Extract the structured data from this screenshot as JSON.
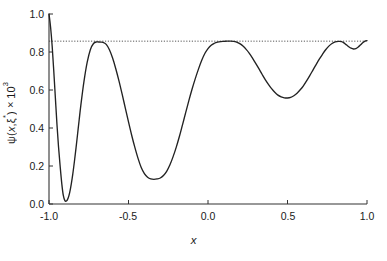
{
  "chart_data": {
    "type": "line",
    "title": "",
    "subtitle": "",
    "xlabel": "x",
    "ylabel": "ψ(x,ξ*)×10³",
    "ylabel_parts": {
      "psi": "ψ(",
      "x": "x",
      "comma": ",",
      "xi": "ξ",
      "star": "*",
      "close": ")×10",
      "exponent": "3"
    },
    "xlim": [
      -1.0,
      1.0
    ],
    "ylim": [
      0.0,
      1.0
    ],
    "xticks": [
      -1.0,
      -0.5,
      0.0,
      0.5,
      1.0
    ],
    "xtick_labels": [
      "-1.0",
      "-0.5",
      "0.0",
      "0.5",
      "1.0"
    ],
    "yticks": [
      0.0,
      0.2,
      0.4,
      0.6,
      0.8,
      1.0
    ],
    "ytick_labels": [
      "0.0",
      "0.2",
      "0.4",
      "0.6",
      "0.8",
      "1.0"
    ],
    "grid": false,
    "legend": null,
    "legend_position": "none",
    "line_color": "#222222",
    "reference_line": {
      "name": "asymptote",
      "style": "dotted",
      "orientation": "horizontal",
      "y": 0.857,
      "color": "#444444"
    },
    "series": [
      {
        "name": "psi",
        "color": "#222222",
        "x": [
          -1.0,
          -0.99,
          -0.98,
          -0.97,
          -0.96,
          -0.95,
          -0.94,
          -0.93,
          -0.92,
          -0.91,
          -0.9,
          -0.89,
          -0.88,
          -0.87,
          -0.86,
          -0.85,
          -0.84,
          -0.83,
          -0.82,
          -0.81,
          -0.8,
          -0.78,
          -0.76,
          -0.74,
          -0.72,
          -0.7,
          -0.68,
          -0.66,
          -0.64,
          -0.62,
          -0.6,
          -0.58,
          -0.56,
          -0.54,
          -0.52,
          -0.5,
          -0.48,
          -0.46,
          -0.44,
          -0.42,
          -0.4,
          -0.38,
          -0.36,
          -0.34,
          -0.32,
          -0.3,
          -0.28,
          -0.26,
          -0.24,
          -0.22,
          -0.2,
          -0.18,
          -0.16,
          -0.14,
          -0.12,
          -0.1,
          -0.08,
          -0.06,
          -0.04,
          -0.02,
          0.0,
          0.02,
          0.04,
          0.06,
          0.08,
          0.1,
          0.12,
          0.14,
          0.16,
          0.18,
          0.2,
          0.22,
          0.24,
          0.26,
          0.28,
          0.3,
          0.32,
          0.34,
          0.36,
          0.38,
          0.4,
          0.42,
          0.44,
          0.46,
          0.48,
          0.5,
          0.52,
          0.54,
          0.56,
          0.58,
          0.6,
          0.62,
          0.64,
          0.66,
          0.68,
          0.7,
          0.72,
          0.74,
          0.76,
          0.78,
          0.8,
          0.82,
          0.84,
          0.855,
          0.87,
          0.885,
          0.9,
          0.915,
          0.93,
          0.945,
          0.96,
          0.975,
          0.99,
          1.0
        ],
        "y": [
          1.0,
          0.93,
          0.83,
          0.7,
          0.56,
          0.42,
          0.3,
          0.2,
          0.11,
          0.045,
          0.018,
          0.016,
          0.03,
          0.06,
          0.105,
          0.16,
          0.225,
          0.295,
          0.37,
          0.445,
          0.518,
          0.645,
          0.745,
          0.812,
          0.845,
          0.853,
          0.852,
          0.851,
          0.84,
          0.812,
          0.768,
          0.712,
          0.648,
          0.578,
          0.505,
          0.432,
          0.362,
          0.298,
          0.24,
          0.192,
          0.16,
          0.141,
          0.132,
          0.13,
          0.132,
          0.137,
          0.15,
          0.172,
          0.205,
          0.248,
          0.298,
          0.355,
          0.418,
          0.482,
          0.545,
          0.605,
          0.66,
          0.71,
          0.755,
          0.792,
          0.818,
          0.836,
          0.846,
          0.852,
          0.855,
          0.856,
          0.857,
          0.857,
          0.856,
          0.852,
          0.844,
          0.831,
          0.814,
          0.793,
          0.768,
          0.74,
          0.712,
          0.683,
          0.655,
          0.63,
          0.607,
          0.588,
          0.573,
          0.564,
          0.559,
          0.558,
          0.561,
          0.57,
          0.583,
          0.601,
          0.622,
          0.648,
          0.676,
          0.705,
          0.734,
          0.762,
          0.788,
          0.812,
          0.831,
          0.845,
          0.853,
          0.856,
          0.855,
          0.848,
          0.838,
          0.828,
          0.82,
          0.816,
          0.818,
          0.826,
          0.838,
          0.85,
          0.858,
          0.86
        ]
      }
    ],
    "annotations": [
      {
        "name": "first-minimum",
        "x": -0.9,
        "y": 0.018
      },
      {
        "name": "first-maximum",
        "x": -0.67,
        "y": 0.853
      },
      {
        "name": "second-minimum",
        "x": -0.32,
        "y": 0.13
      },
      {
        "name": "second-maximum",
        "x": 0.14,
        "y": 0.857
      },
      {
        "name": "third-minimum",
        "x": 0.51,
        "y": 0.558
      },
      {
        "name": "third-maximum",
        "x": 0.86,
        "y": 0.856
      },
      {
        "name": "fourth-minimum",
        "x": 0.945,
        "y": 0.816
      }
    ]
  },
  "axes": {
    "x_axis_name": "x-axis",
    "y_axis_name": "y-axis"
  }
}
